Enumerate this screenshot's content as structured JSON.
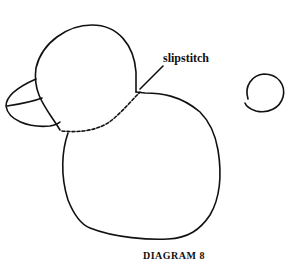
{
  "diagram": {
    "labels": {
      "slipstitch": "slipstitch"
    },
    "caption": "DIAGRAM 8",
    "parts": [
      "head",
      "beak",
      "body",
      "tail",
      "slipstitch-seam"
    ],
    "colors": {
      "line": "#111111",
      "background": "#ffffff"
    }
  }
}
